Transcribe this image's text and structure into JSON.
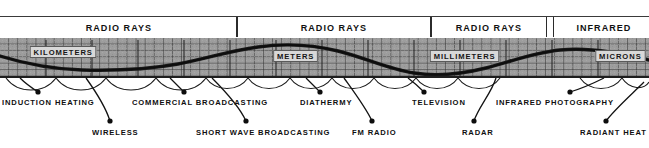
{
  "figure": {
    "background_color": "#ffffff",
    "band_color": "#9d9d9d",
    "ink_color": "#101010"
  },
  "header": {
    "cells": [
      {
        "label": "RADIO RAYS",
        "x": 2,
        "width": 235
      },
      {
        "label": "RADIO RAYS",
        "x": 237,
        "width": 194
      },
      {
        "label": "RADIO RAYS",
        "x": 431,
        "width": 116
      },
      {
        "label": "INFRARED",
        "x": 553,
        "width": 100
      }
    ]
  },
  "band": {
    "top": 38,
    "height": 40,
    "tags": [
      {
        "label": "KILOMETERS",
        "x": 28,
        "y": 46
      },
      {
        "label": "METERS",
        "x": 272,
        "y": 50
      },
      {
        "label": "MILLIMETERS",
        "x": 428,
        "y": 50
      },
      {
        "label": "MICRONS",
        "x": 594,
        "y": 50
      }
    ]
  },
  "chart_data": {
    "type": "line",
    "xlabel": "Wavelength",
    "ylabel": "",
    "series": [
      {
        "name": "wavelength-sine",
        "description": "Sinusoidal wave drawn across the spectrum band"
      }
    ],
    "categories": [
      "KILOMETERS",
      "METERS",
      "MILLIMETERS",
      "MICRONS"
    ],
    "bands": [
      "RADIO RAYS",
      "RADIO RAYS",
      "RADIO RAYS",
      "INFRARED"
    ]
  },
  "callouts": {
    "upper_row": [
      {
        "label": "INDUCTION HEATING",
        "text_x": 2,
        "text_y": 98,
        "dot_x": 38,
        "dot_y": 92
      },
      {
        "label": "COMMERCIAL BROADCASTING",
        "text_x": 132,
        "text_y": 98,
        "dot_x": 184,
        "dot_y": 92
      },
      {
        "label": "DIATHERMY",
        "text_x": 300,
        "text_y": 98,
        "dot_x": 320,
        "dot_y": 92
      },
      {
        "label": "TELEVISION",
        "text_x": 412,
        "text_y": 98,
        "dot_x": 424,
        "dot_y": 92
      },
      {
        "label": "INFRARED PHOTOGRAPHY",
        "text_x": 496,
        "text_y": 98,
        "dot_x": 570,
        "dot_y": 92
      }
    ],
    "lower_row": [
      {
        "label": "WIRELESS",
        "text_x": 92,
        "text_y": 128,
        "dot_x": 110,
        "dot_y": 121
      },
      {
        "label": "SHORT WAVE BROADCASTING",
        "text_x": 196,
        "text_y": 128,
        "dot_x": 246,
        "dot_y": 121
      },
      {
        "label": "FM RADIO",
        "text_x": 352,
        "text_y": 128,
        "dot_x": 372,
        "dot_y": 121
      },
      {
        "label": "RADAR",
        "text_x": 462,
        "text_y": 128,
        "dot_x": 474,
        "dot_y": 121
      },
      {
        "label": "RADIANT HEAT",
        "text_x": 580,
        "text_y": 128,
        "dot_x": 606,
        "dot_y": 121
      }
    ]
  }
}
